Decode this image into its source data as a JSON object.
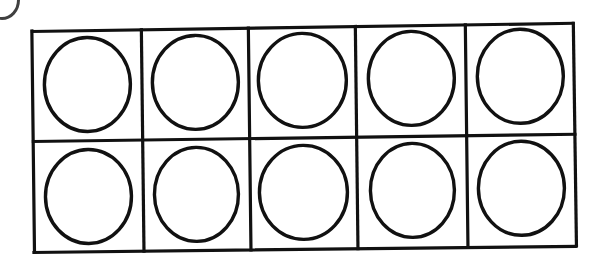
{
  "worksheet": {
    "title": "Ten Frame",
    "description": "A blank ten frame grid with an empty circle counter drawn inside each of the ten cells.",
    "medium": "scanned black ink line drawing on white paper",
    "background_color": "#ffffff",
    "ink_color": "#111111",
    "artifact": {
      "name": "scan-artifact",
      "description": "faint dark arc in the extreme top-left corner of the scan"
    }
  },
  "grid": {
    "rows": 2,
    "columns": 5,
    "total_cells": 10,
    "outer_border_width_px": 3,
    "divider_width_px": 3,
    "frame": {
      "x": 32,
      "y": 24,
      "width": 546,
      "height": 229
    },
    "row_labels": [
      "top-row",
      "bottom-row"
    ],
    "column_labels": [
      "column-1",
      "column-2",
      "column-3",
      "column-4",
      "column-5"
    ]
  },
  "counters": {
    "shape": "circle",
    "fill": "none",
    "stroke_color": "#111111",
    "stroke_width_px": 3,
    "count": 10,
    "filled_count": 0,
    "empty_count": 10,
    "items": [
      {
        "id": "counter-r1c1",
        "row": 1,
        "column": 1,
        "state": "empty"
      },
      {
        "id": "counter-r1c2",
        "row": 1,
        "column": 2,
        "state": "empty"
      },
      {
        "id": "counter-r1c3",
        "row": 1,
        "column": 3,
        "state": "empty"
      },
      {
        "id": "counter-r1c4",
        "row": 1,
        "column": 4,
        "state": "empty"
      },
      {
        "id": "counter-r1c5",
        "row": 1,
        "column": 5,
        "state": "empty"
      },
      {
        "id": "counter-r2c1",
        "row": 2,
        "column": 1,
        "state": "empty"
      },
      {
        "id": "counter-r2c2",
        "row": 2,
        "column": 2,
        "state": "empty"
      },
      {
        "id": "counter-r2c3",
        "row": 2,
        "column": 3,
        "state": "empty"
      },
      {
        "id": "counter-r2c4",
        "row": 2,
        "column": 4,
        "state": "empty"
      },
      {
        "id": "counter-r2c5",
        "row": 2,
        "column": 5,
        "state": "empty"
      }
    ]
  },
  "labels": {
    "none_visible": ""
  }
}
